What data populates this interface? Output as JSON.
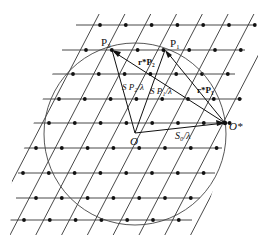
{
  "diagram": {
    "type": "ewald-sphere-reciprocal-lattice",
    "colors": {
      "line": "#222222",
      "point": "#111111",
      "background": "#ffffff"
    },
    "labels": {
      "p2": "P₂",
      "p1": "P₁",
      "r_p2": "r*P₂",
      "r_p1": "r*P₁",
      "s_p2": "S P₂/λ",
      "s_p1": "S P₁/λ",
      "s0": "S₀/λ",
      "o": "O",
      "o_star": "O*"
    },
    "points": {
      "O": [
        135,
        133
      ],
      "O_star": [
        225,
        123
      ],
      "P1": [
        165,
        50
      ],
      "P2": [
        112,
        50
      ]
    },
    "sphere": {
      "cx": 135,
      "cy": 134,
      "r": 91
    }
  }
}
